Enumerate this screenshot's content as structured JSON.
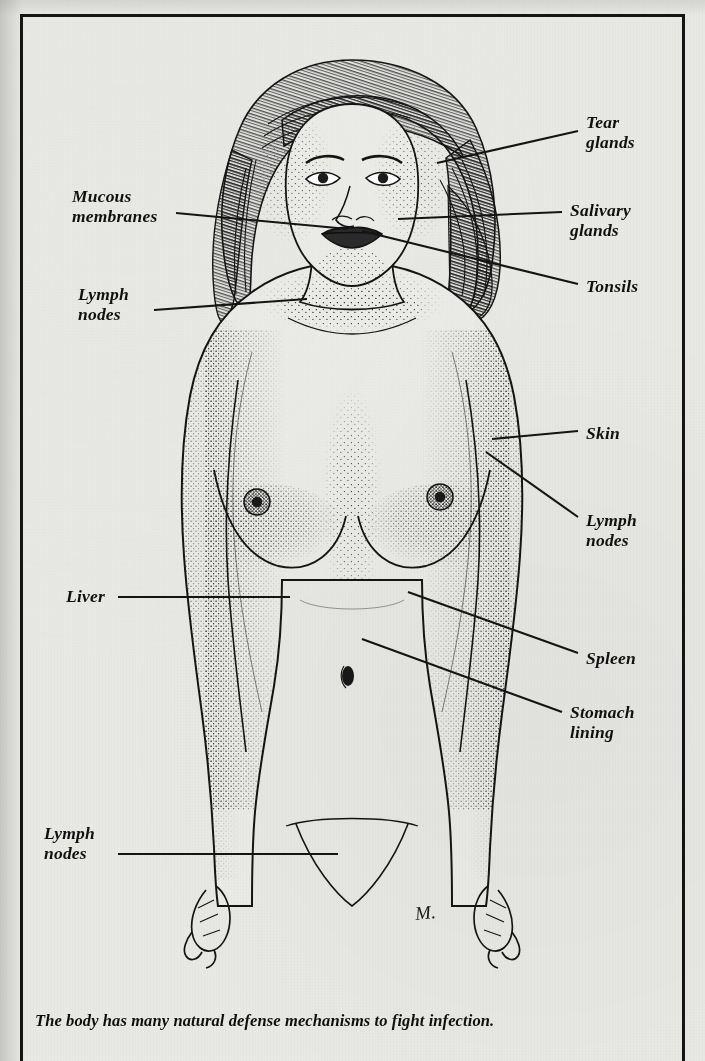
{
  "figure": {
    "caption": "The body has many natural defense mechanisms to fight infection.",
    "signature": "M.",
    "style": "pen-and-ink stipple illustration",
    "border_color": "#151515",
    "paper_color": "#e9e9e6",
    "ink_color": "#141414"
  },
  "labels": [
    {
      "id": "tear-glands",
      "text": "Tear\nglands",
      "side": "right",
      "x": 586,
      "y": 112,
      "leader": [
        [
          578,
          131
        ],
        [
          437,
          163
        ]
      ]
    },
    {
      "id": "salivary-glands",
      "text": "Salivary\nglands",
      "side": "right",
      "x": 570,
      "y": 200,
      "leader": [
        [
          562,
          212
        ],
        [
          398,
          219
        ]
      ]
    },
    {
      "id": "tonsils",
      "text": "Tonsils",
      "side": "right",
      "x": 586,
      "y": 276,
      "leader": [
        [
          578,
          284
        ],
        [
          362,
          231
        ]
      ]
    },
    {
      "id": "mucous-membranes",
      "text": "Mucous\nmembranes",
      "side": "left",
      "x": 72,
      "y": 186,
      "leader": [
        [
          176,
          213
        ],
        [
          348,
          229
        ]
      ]
    },
    {
      "id": "lymph-nodes-neck",
      "text": "Lymph\nnodes",
      "side": "left",
      "x": 78,
      "y": 284,
      "leader": [
        [
          154,
          310
        ],
        [
          307,
          299
        ]
      ]
    },
    {
      "id": "skin",
      "text": "Skin",
      "side": "right",
      "x": 586,
      "y": 423,
      "leader": [
        [
          578,
          431
        ],
        [
          492,
          439
        ]
      ]
    },
    {
      "id": "lymph-nodes-arm",
      "text": "Lymph\nnodes",
      "side": "right",
      "x": 586,
      "y": 510,
      "leader": [
        [
          578,
          517
        ],
        [
          486,
          452
        ]
      ]
    },
    {
      "id": "liver",
      "text": "Liver",
      "side": "left",
      "x": 66,
      "y": 586,
      "leader": [
        [
          118,
          597
        ],
        [
          290,
          597
        ]
      ]
    },
    {
      "id": "spleen",
      "text": "Spleen",
      "side": "right",
      "x": 586,
      "y": 648,
      "leader": [
        [
          578,
          653
        ],
        [
          408,
          592
        ]
      ]
    },
    {
      "id": "stomach-lining",
      "text": "Stomach\nlining",
      "side": "right",
      "x": 570,
      "y": 702,
      "leader": [
        [
          562,
          712
        ],
        [
          362,
          639
        ]
      ]
    },
    {
      "id": "lymph-nodes-groin",
      "text": "Lymph\nnodes",
      "side": "left",
      "x": 44,
      "y": 823,
      "leader": [
        [
          118,
          854
        ],
        [
          338,
          854
        ]
      ]
    }
  ],
  "anatomy_parts": [
    "head",
    "hair",
    "face",
    "eyes",
    "nose",
    "mouth",
    "neck",
    "shoulders",
    "chest",
    "breasts",
    "abdomen",
    "navel",
    "hips",
    "arms",
    "hands",
    "pubic-area"
  ]
}
